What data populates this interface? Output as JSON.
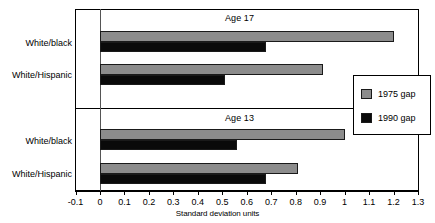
{
  "chart_data": {
    "type": "bar",
    "orientation": "horizontal",
    "title": "",
    "xlabel": "Standard deviation units",
    "ylabel": "",
    "xlim": [
      -0.1,
      1.3
    ],
    "xticks": [
      "-0.1",
      "0",
      "0.1",
      "0.2",
      "0.3",
      "0.4",
      "0.5",
      "0.6",
      "0.7",
      "0.8",
      "0.9",
      "1",
      "1.1",
      "1.2",
      "1.3"
    ],
    "xtick_values": [
      -0.1,
      0,
      0.1,
      0.2,
      0.3,
      0.4,
      0.5,
      0.6,
      0.7,
      0.8,
      0.9,
      1.0,
      1.1,
      1.2,
      1.3
    ],
    "grid": false,
    "legend_position": "right",
    "legend": [
      {
        "name": "1975 gap",
        "color": "#8c8c8c"
      },
      {
        "name": "1990 gap",
        "color": "#0a0a0a"
      }
    ],
    "panels": [
      {
        "title": "Age 17",
        "categories": [
          "White/black",
          "White/Hispanic"
        ],
        "series": [
          {
            "name": "1975 gap",
            "color": "#8c8c8c",
            "values": [
              1.2,
              0.91
            ]
          },
          {
            "name": "1990 gap",
            "color": "#0a0a0a",
            "values": [
              0.68,
              0.51
            ]
          }
        ]
      },
      {
        "title": "Age 13",
        "categories": [
          "White/black",
          "White/Hispanic"
        ],
        "series": [
          {
            "name": "1975 gap",
            "color": "#8c8c8c",
            "values": [
              1.0,
              0.81
            ]
          },
          {
            "name": "1990 gap",
            "color": "#0a0a0a",
            "values": [
              0.56,
              0.68
            ]
          }
        ]
      }
    ]
  },
  "labels": {
    "panel_0_title": "Age 17",
    "panel_1_title": "Age 13",
    "cat_p0_0": "White/black",
    "cat_p0_1": "White/Hispanic",
    "cat_p1_0": "White/black",
    "cat_p1_1": "White/Hispanic",
    "axis_title": "Standard deviation units",
    "legend_0": "1975 gap",
    "legend_1": "1990 gap",
    "tick_0": "-0.1",
    "tick_1": "0",
    "tick_2": "0.1",
    "tick_3": "0.2",
    "tick_4": "0.3",
    "tick_5": "0.4",
    "tick_6": "0.5",
    "tick_7": "0.6",
    "tick_8": "0.7",
    "tick_9": "0.8",
    "tick_10": "0.9",
    "tick_11": "1",
    "tick_12": "1.1",
    "tick_13": "1.2",
    "tick_14": "1.3"
  },
  "geometry": {
    "zero_x": 100,
    "px_per_unit": 244.6,
    "panels": [
      {
        "bar_tops": [
          31,
          41.5,
          64,
          74.5
        ],
        "bar_height": 10.5
      },
      {
        "bar_tops": [
          129,
          139.5,
          163,
          173.5
        ],
        "bar_height": 10.5
      }
    ]
  }
}
